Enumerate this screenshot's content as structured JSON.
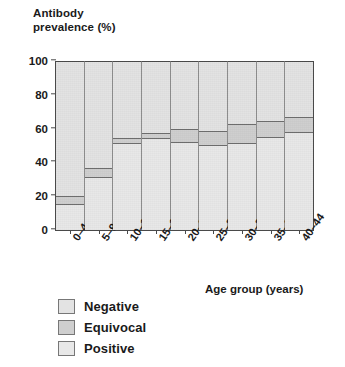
{
  "chart_data": {
    "type": "bar",
    "subtype": "stacked-percentage",
    "title": "",
    "ylabel": "Antibody\nprevalence (%)",
    "xlabel": "Age group (years)",
    "ylim": [
      0,
      100
    ],
    "yticks": [
      0,
      20,
      40,
      60,
      80,
      100
    ],
    "grid": false,
    "legend_position": "below-left",
    "categories": [
      "0–4",
      "5–9",
      "10–14",
      "15–19",
      "20–24",
      "25–29",
      "30–34",
      "35–39",
      "40–44"
    ],
    "series": [
      {
        "name": "Positive",
        "color": "#e8e8e8",
        "values": [
          15,
          31,
          51,
          54,
          52,
          50,
          51,
          55,
          58
        ]
      },
      {
        "name": "Equivocal",
        "color": "#cfcfcf",
        "values": [
          5,
          6,
          4,
          4,
          8,
          9,
          12,
          10,
          9
        ]
      },
      {
        "name": "Negative",
        "color": "#e3e3e3",
        "values": [
          80,
          63,
          45,
          42,
          40,
          41,
          37,
          35,
          33
        ]
      }
    ]
  },
  "legend": {
    "items": [
      {
        "label": "Negative",
        "color": "#e3e3e3"
      },
      {
        "label": "Equivocal",
        "color": "#cfcfcf"
      },
      {
        "label": "Positive",
        "color": "#e8e8e8"
      }
    ]
  }
}
